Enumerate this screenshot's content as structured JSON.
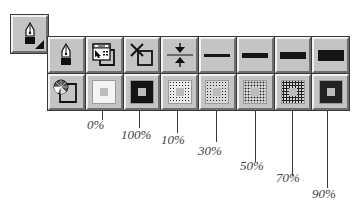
{
  "main_tool": {
    "icon": "pen-nib-icon",
    "has_submenu_indicator": true
  },
  "palette": {
    "rows": [
      [
        {
          "kind": "icon",
          "icon": "pen-nib-icon",
          "name": "pen-tool"
        },
        {
          "kind": "icon",
          "icon": "pen-style-dialog-icon",
          "name": "pen-style-dialog"
        },
        {
          "kind": "icon",
          "icon": "no-pen-icon",
          "name": "no-pen"
        },
        {
          "kind": "icon",
          "icon": "hairline-icon",
          "name": "hairline"
        },
        {
          "kind": "line",
          "weight": 3,
          "name": "line-weight-1"
        },
        {
          "kind": "line",
          "weight": 5,
          "name": "line-weight-2"
        },
        {
          "kind": "line",
          "weight": 7,
          "name": "line-weight-3"
        },
        {
          "kind": "line",
          "weight": 11,
          "name": "line-weight-4"
        }
      ],
      [
        {
          "kind": "icon",
          "icon": "color-wheel-dialog-icon",
          "name": "color-dialog"
        },
        {
          "kind": "fill",
          "percent": 0,
          "name": "fill-0"
        },
        {
          "kind": "fill",
          "percent": 100,
          "name": "fill-100"
        },
        {
          "kind": "fill",
          "percent": 10,
          "name": "fill-10"
        },
        {
          "kind": "fill",
          "percent": 30,
          "name": "fill-30"
        },
        {
          "kind": "fill",
          "percent": 50,
          "name": "fill-50"
        },
        {
          "kind": "fill",
          "percent": 70,
          "name": "fill-70"
        },
        {
          "kind": "fill",
          "percent": 90,
          "name": "fill-90"
        }
      ]
    ]
  },
  "callouts": [
    {
      "label": "0%",
      "x": 102,
      "line_end": 120,
      "label_x": 87,
      "label_y": 117
    },
    {
      "label": "100%",
      "x": 139,
      "line_end": 128,
      "label_x": 121,
      "label_y": 127
    },
    {
      "label": "10%",
      "x": 177,
      "line_end": 133,
      "label_x": 161,
      "label_y": 132
    },
    {
      "label": "30%",
      "x": 216,
      "line_end": 142,
      "label_x": 198,
      "label_y": 143
    },
    {
      "label": "50%",
      "x": 255,
      "line_end": 162,
      "label_x": 240,
      "label_y": 158
    },
    {
      "label": "70%",
      "x": 292,
      "line_end": 176,
      "label_x": 276,
      "label_y": 170
    },
    {
      "label": "90%",
      "x": 327,
      "line_end": 188,
      "label_x": 312,
      "label_y": 186
    }
  ],
  "colors": {
    "button_face": "#c4c4c4",
    "highlight": "#f2f2f2",
    "shadow": "#6e6e6e",
    "ink": "#151515"
  }
}
